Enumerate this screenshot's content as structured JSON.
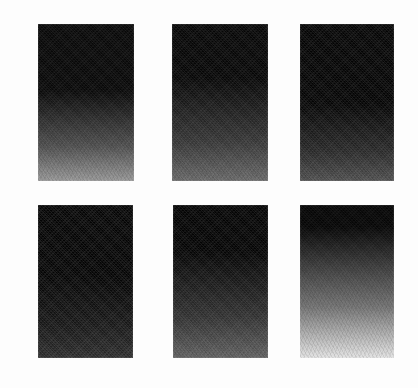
{
  "figure": {
    "title": "",
    "background_color": "#fdfdfd",
    "width": 418,
    "height": 388,
    "rows": 2,
    "columns": 3
  },
  "chart_data": {
    "type": "heatmap",
    "title": "",
    "subtitle": "",
    "xlabel": "",
    "ylabel": "",
    "legend_position": "none",
    "grid": false,
    "colormap": "grayscale-black-to-white",
    "value_axis": "vertical, top = 0 (black) to bottom = panel brightness endpoint",
    "value_range": [
      0,
      255
    ],
    "panels": [
      {
        "index": 1,
        "row": 1,
        "column": 1,
        "label": "",
        "x": 38,
        "y": 24,
        "width": 96,
        "height": 157,
        "top_value": 8,
        "bottom_value": 150,
        "ramp_start_fraction": 0.42,
        "texture": "halftone-dither"
      },
      {
        "index": 2,
        "row": 1,
        "column": 2,
        "label": "",
        "x": 172,
        "y": 24,
        "width": 96,
        "height": 157,
        "top_value": 6,
        "bottom_value": 104,
        "ramp_start_fraction": 0.34,
        "texture": "halftone-dither"
      },
      {
        "index": 3,
        "row": 1,
        "column": 3,
        "label": "",
        "x": 300,
        "y": 24,
        "width": 94,
        "height": 157,
        "top_value": 4,
        "bottom_value": 78,
        "ramp_start_fraction": 0.5,
        "texture": "halftone-dither"
      },
      {
        "index": 4,
        "row": 2,
        "column": 1,
        "label": "",
        "x": 38,
        "y": 205,
        "width": 95,
        "height": 153,
        "top_value": 4,
        "bottom_value": 44,
        "ramp_start_fraction": 0.46,
        "texture": "halftone-dither"
      },
      {
        "index": 5,
        "row": 2,
        "column": 2,
        "label": "",
        "x": 173,
        "y": 205,
        "width": 95,
        "height": 153,
        "top_value": 4,
        "bottom_value": 96,
        "ramp_start_fraction": 0.3,
        "texture": "halftone-dither"
      },
      {
        "index": 6,
        "row": 2,
        "column": 3,
        "label": "",
        "x": 300,
        "y": 205,
        "width": 94,
        "height": 153,
        "top_value": 6,
        "bottom_value": 226,
        "ramp_start_fraction": 0.14,
        "texture": "halftone-dither"
      }
    ]
  }
}
